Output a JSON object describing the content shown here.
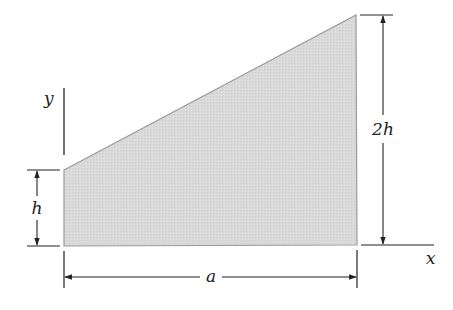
{
  "figure": {
    "type": "area-diagram",
    "shape": "trapezoid",
    "fill_color": "#d9d9d9",
    "edge_color": "#9a9a9a",
    "line_color": "#222222",
    "vertices": [
      [
        64,
        170
      ],
      [
        356,
        15
      ],
      [
        357,
        245
      ],
      [
        64,
        246
      ]
    ]
  },
  "axes": {
    "y_label": "y",
    "x_label": "x"
  },
  "dimensions": {
    "left_height": "h",
    "right_height": "2h",
    "width": "a"
  }
}
